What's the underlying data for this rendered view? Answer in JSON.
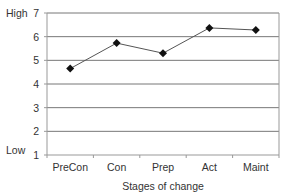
{
  "chart_data": {
    "type": "line",
    "title": "",
    "xlabel": "Stages of change",
    "ylabel": "",
    "categories": [
      "PreCon",
      "Con",
      "Prep",
      "Act",
      "Maint"
    ],
    "series": [
      {
        "name": "Stage score",
        "values": [
          4.65,
          5.73,
          5.3,
          6.37,
          6.28
        ]
      }
    ],
    "ylim": [
      1,
      7
    ],
    "yticks": [
      1,
      2,
      3,
      4,
      5,
      6,
      7
    ],
    "y_annotations": {
      "high": "High",
      "low": "Low"
    },
    "grid": true,
    "legend": "none",
    "colors": {
      "line": "#555555",
      "marker": "#111111",
      "grid": "#777777",
      "frame": "#999999"
    }
  }
}
